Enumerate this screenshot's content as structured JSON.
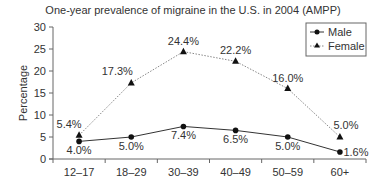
{
  "chart_data": {
    "type": "line",
    "title": "One-year prevalence of migraine in the U.S. in 2004 (AMPP)",
    "xlabel": "",
    "ylabel": "Percentage",
    "ylim": [
      0,
      30
    ],
    "yticks": [
      0,
      5,
      10,
      15,
      20,
      25,
      30
    ],
    "grid": false,
    "legend_position": "top-right",
    "categories": [
      "12–17",
      "18–29",
      "30–39",
      "40–49",
      "50–59",
      "60+"
    ],
    "series": [
      {
        "name": "Male",
        "marker": "circle",
        "line_style": "solid",
        "values": [
          4.0,
          5.0,
          7.4,
          6.5,
          5.0,
          1.6
        ],
        "labels": [
          "4.0%",
          "5.0%",
          "7.4%",
          "6.5%",
          "5.0%",
          "1.6%"
        ]
      },
      {
        "name": "Female",
        "marker": "triangle",
        "line_style": "dotted",
        "values": [
          5.4,
          17.3,
          24.4,
          22.2,
          16.0,
          5.0
        ],
        "labels": [
          "5.4%",
          "17.3%",
          "24.4%",
          "22.2%",
          "16.0%",
          "5.0%"
        ]
      }
    ]
  },
  "colors": {
    "male_line": "#333333",
    "female_line": "#888888",
    "axis": "#666666",
    "text": "#333333"
  }
}
